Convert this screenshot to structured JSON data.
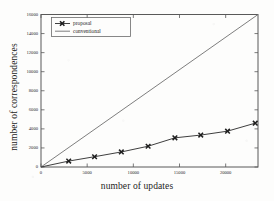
{
  "chart_data": {
    "type": "line",
    "title": "",
    "xlabel": "number of updates",
    "ylabel": "number of correspondences",
    "xlim": [
      0,
      23500
    ],
    "ylim": [
      0,
      16000
    ],
    "xticks": [
      0,
      5000,
      10000,
      15000,
      20000
    ],
    "xtick_labels": [
      "0",
      "5000",
      "10000",
      "15000",
      "20000"
    ],
    "yticks": [
      0,
      2000,
      4000,
      6000,
      8000,
      10000,
      12000,
      14000,
      16000
    ],
    "ytick_labels": [
      "0",
      "2000",
      "4000",
      "6000",
      "8000",
      "10000",
      "12000",
      "14000",
      "16000"
    ],
    "grid": false,
    "legend_position": "upper left",
    "series": [
      {
        "name": "proposal",
        "marker": "x",
        "line_style": "solid",
        "color": "#3a3a3a",
        "x": [
          0,
          3000,
          5800,
          8700,
          11600,
          14500,
          17300,
          20200,
          23200
        ],
        "y": [
          0,
          620,
          1080,
          1580,
          2180,
          3060,
          3350,
          3760,
          4600
        ]
      },
      {
        "name": "conventional",
        "marker": "none",
        "line_style": "solid",
        "color": "#6b6b6b",
        "x": [
          0,
          23500
        ],
        "y": [
          0,
          16000
        ]
      }
    ]
  },
  "legend": {
    "entries": [
      {
        "label": "proposal",
        "marker": "x-marker"
      },
      {
        "label": "conventional",
        "marker": "plain-line"
      }
    ]
  },
  "figure": {
    "background_color": "#fdfdfc",
    "axis_color": "#555555",
    "text_color": "#1d1d1d"
  }
}
